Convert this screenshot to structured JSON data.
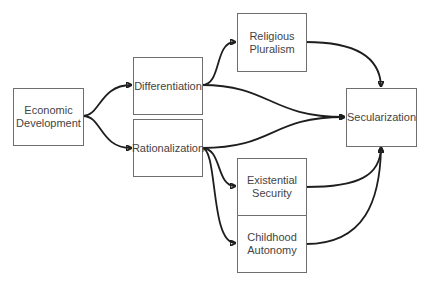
{
  "diagram": {
    "type": "causal flow diagram",
    "nodes": [
      {
        "id": "economic_development",
        "label": "Economic\nDevelopment"
      },
      {
        "id": "differentiation",
        "label": "Differentiation"
      },
      {
        "id": "rationalization",
        "label": "Rationalization"
      },
      {
        "id": "religious_pluralism",
        "label": "Religious\nPluralism"
      },
      {
        "id": "secularization",
        "label": "Secularization"
      },
      {
        "id": "existential_security",
        "label": "Existential\nSecurity"
      },
      {
        "id": "childhood_autonomy",
        "label": "Childhood\nAutonomy"
      }
    ],
    "edges": [
      {
        "from": "economic_development",
        "to": "differentiation"
      },
      {
        "from": "economic_development",
        "to": "rationalization"
      },
      {
        "from": "differentiation",
        "to": "religious_pluralism"
      },
      {
        "from": "differentiation",
        "to": "secularization"
      },
      {
        "from": "rationalization",
        "to": "secularization"
      },
      {
        "from": "rationalization",
        "to": "existential_security"
      },
      {
        "from": "rationalization",
        "to": "childhood_autonomy"
      },
      {
        "from": "religious_pluralism",
        "to": "secularization"
      },
      {
        "from": "existential_security",
        "to": "secularization"
      },
      {
        "from": "childhood_autonomy",
        "to": "secularization"
      }
    ],
    "colors": {
      "edge": "#1e1e1e",
      "border": "#6f6f6f",
      "text": "#444444"
    }
  }
}
